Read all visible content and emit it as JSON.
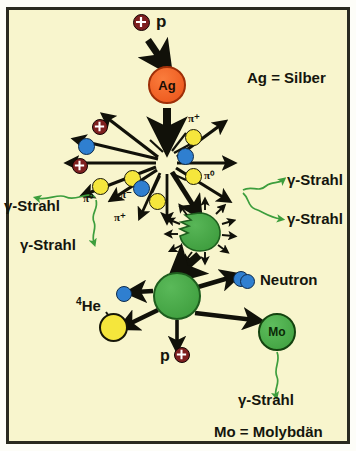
{
  "diagram": {
    "background_color": "#f8f5cd",
    "border_color": "#2a2a20",
    "colors": {
      "proton": "#7e1f1f",
      "neutron": "#2f7fd0",
      "pion_charged_yellow": "#f5e63c",
      "pion_minus_blue": "#2f7fd0",
      "silver_nucleus": "#f2622a",
      "green_nucleus": "#3f9f3f",
      "helium": "#f5e63c",
      "gamma_ray": "#3d9e3d",
      "arrow": "#111109",
      "text": "#15150d"
    }
  },
  "legend": {
    "silver": "Ag = Silber",
    "molybdenum": "Mo = Molybdän"
  },
  "nuclei": [
    {
      "id": "ag",
      "label": "Ag",
      "color": "#f2622a",
      "x": 167,
      "y": 85,
      "r": 19
    },
    {
      "id": "mo",
      "label": "Mo",
      "color": "#4fae4f",
      "x": 277,
      "y": 332,
      "r": 19
    },
    {
      "id": "residual",
      "label": "",
      "color": "#3f9f3f",
      "x": 177,
      "y": 296,
      "r": 24
    },
    {
      "id": "excited",
      "label": "",
      "color": "#3f9f3f",
      "x": 199,
      "y": 232,
      "r": 17
    }
  ],
  "incident": {
    "particle_label": "p",
    "particle_type": "proton"
  },
  "cascade_particles": [
    {
      "type": "proton",
      "x": 100,
      "y": 128
    },
    {
      "type": "neutron",
      "x": 86,
      "y": 146
    },
    {
      "type": "proton",
      "x": 80,
      "y": 166
    },
    {
      "type": "pion0",
      "x": 100,
      "y": 186,
      "label": "π⁰"
    },
    {
      "type": "pion0",
      "x": 132,
      "y": 178,
      "label": ""
    },
    {
      "type": "pionm",
      "x": 141,
      "y": 188,
      "label": "π⁻"
    },
    {
      "type": "pionp",
      "x": 157,
      "y": 201,
      "label": "π⁺"
    },
    {
      "type": "pionp",
      "x": 193,
      "y": 137,
      "label": "π⁺"
    },
    {
      "type": "pionm",
      "x": 185,
      "y": 156,
      "label": ""
    },
    {
      "type": "pion0",
      "x": 193,
      "y": 176,
      "label": "π⁰"
    }
  ],
  "pion_labels": [
    {
      "text": "π⁺",
      "x": 188,
      "y": 118
    },
    {
      "text": "π⁰",
      "x": 203,
      "y": 174
    },
    {
      "text": "π⁰",
      "x": 85,
      "y": 196
    },
    {
      "text": "π⁻",
      "x": 124,
      "y": 192
    },
    {
      "text": "π⁺",
      "x": 118,
      "y": 215
    }
  ],
  "gamma_labels": [
    {
      "text": "γ-Strahl",
      "x": 5,
      "y": 203
    },
    {
      "text": "γ-Strahl",
      "x": 22,
      "y": 234
    },
    {
      "text": "γ-Strahl",
      "x": 288,
      "y": 177
    },
    {
      "text": "γ-Strahl",
      "x": 288,
      "y": 214
    },
    {
      "text": "γ-Strahl",
      "x": 238,
      "y": 395
    }
  ],
  "product_labels": [
    {
      "text": "Neutron",
      "x": 258,
      "y": 281
    },
    {
      "text": "4He",
      "x": 78,
      "y": 305,
      "sup": "4",
      "base": "He"
    },
    {
      "text": "p",
      "x": 166,
      "y": 352
    }
  ],
  "products": [
    {
      "type": "neutron",
      "x": 240,
      "y": 280,
      "name": "neutron-right"
    },
    {
      "type": "neutron",
      "x": 124,
      "y": 294,
      "name": "neutron-left"
    },
    {
      "type": "helium",
      "x": 113,
      "y": 327,
      "name": "helium-4"
    },
    {
      "type": "proton",
      "x": 182,
      "y": 355,
      "name": "proton-emitted"
    }
  ]
}
